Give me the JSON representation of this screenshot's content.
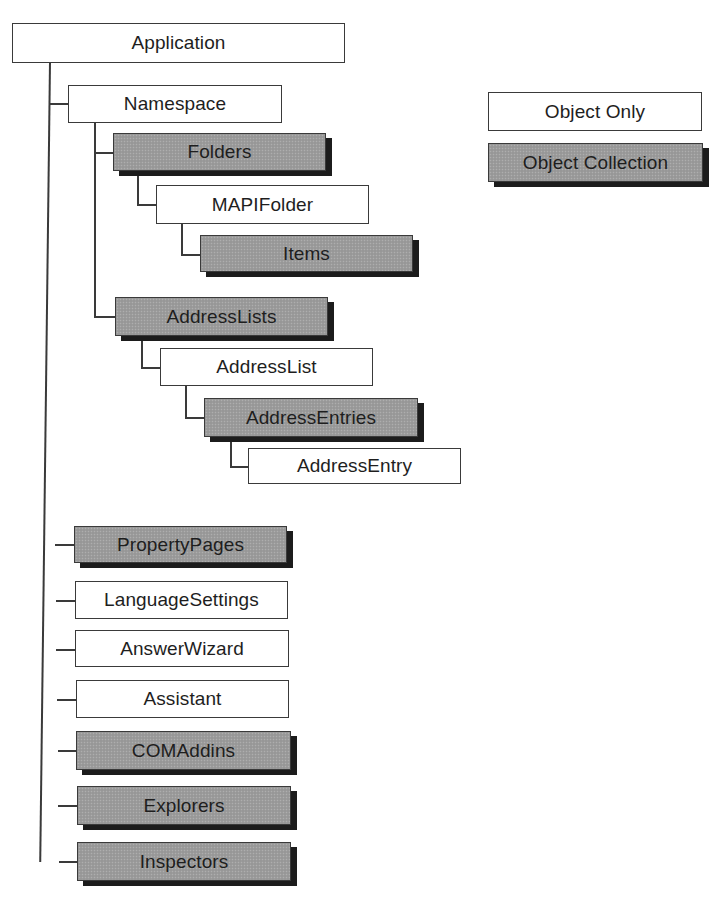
{
  "diagram": {
    "type": "object-model-hierarchy",
    "root": "Application",
    "nodes": [
      {
        "id": "application",
        "label": "Application",
        "kind": "object",
        "parent": null,
        "box": [
          12,
          23,
          333,
          40
        ]
      },
      {
        "id": "namespace",
        "label": "Namespace",
        "kind": "object",
        "parent": "application",
        "box": [
          68,
          85,
          214,
          38
        ]
      },
      {
        "id": "folders",
        "label": "Folders",
        "kind": "collection",
        "parent": "namespace",
        "box": [
          113,
          133,
          213,
          38
        ]
      },
      {
        "id": "mapifolder",
        "label": "MAPIFolder",
        "kind": "object",
        "parent": "folders",
        "box": [
          156,
          185,
          213,
          39
        ]
      },
      {
        "id": "items",
        "label": "Items",
        "kind": "collection",
        "parent": "mapifolder",
        "box": [
          200,
          235,
          213,
          37
        ]
      },
      {
        "id": "addresslists",
        "label": "AddressLists",
        "kind": "collection",
        "parent": "namespace",
        "box": [
          115,
          297,
          213,
          39
        ]
      },
      {
        "id": "addresslist",
        "label": "AddressList",
        "kind": "object",
        "parent": "addresslists",
        "box": [
          160,
          348,
          213,
          38
        ]
      },
      {
        "id": "addressentries",
        "label": "AddressEntries",
        "kind": "collection",
        "parent": "addresslist",
        "box": [
          204,
          398,
          214,
          39
        ]
      },
      {
        "id": "addressentry",
        "label": "AddressEntry",
        "kind": "object",
        "parent": "addressentries",
        "box": [
          248,
          448,
          213,
          36
        ]
      },
      {
        "id": "propertypages",
        "label": "PropertyPages",
        "kind": "collection",
        "parent": "application",
        "box": [
          74,
          526,
          213,
          37
        ]
      },
      {
        "id": "languagesettings",
        "label": "LanguageSettings",
        "kind": "object",
        "parent": "application",
        "box": [
          75,
          581,
          213,
          38
        ]
      },
      {
        "id": "answerwizard",
        "label": "AnswerWizard",
        "kind": "object",
        "parent": "application",
        "box": [
          75,
          630,
          214,
          37
        ]
      },
      {
        "id": "assistant",
        "label": "Assistant",
        "kind": "object",
        "parent": "application",
        "box": [
          76,
          680,
          213,
          38
        ]
      },
      {
        "id": "comaddins",
        "label": "COMAddins",
        "kind": "collection",
        "parent": "application",
        "box": [
          76,
          731,
          215,
          39
        ]
      },
      {
        "id": "explorers",
        "label": "Explorers",
        "kind": "collection",
        "parent": "application",
        "box": [
          77,
          786,
          214,
          39
        ]
      },
      {
        "id": "inspectors",
        "label": "Inspectors",
        "kind": "collection",
        "parent": "application",
        "box": [
          77,
          842,
          214,
          39
        ]
      }
    ]
  },
  "legend": {
    "items": [
      {
        "label": "Object Only",
        "kind": "object",
        "box": [
          488,
          92,
          214,
          39
        ]
      },
      {
        "label": "Object Collection",
        "kind": "collection",
        "box": [
          488,
          143,
          215,
          39
        ]
      }
    ]
  },
  "colors": {
    "line": "#3a3a3a",
    "object_fill": "#ffffff",
    "collection_fill": "#9c9c9c",
    "shadow": "#1c1c1c",
    "text": "#1e1e1e"
  }
}
